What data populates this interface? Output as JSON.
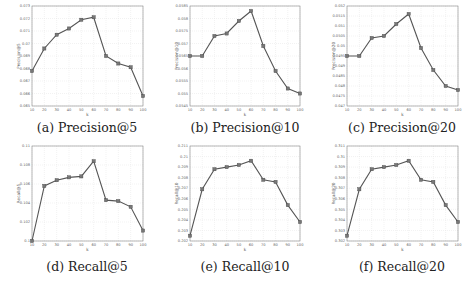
{
  "chart_data": [
    {
      "type": "line",
      "title": "",
      "caption": "(a) Precision@5",
      "xlabel": "k",
      "ylabel": "Precision@5",
      "x": [
        10,
        20,
        30,
        40,
        50,
        60,
        70,
        80,
        90,
        100
      ],
      "xticks": [
        "10",
        "20",
        "30",
        "40",
        "50",
        "60",
        "70",
        "80",
        "90",
        "100"
      ],
      "ylim": [
        0.065,
        0.073
      ],
      "yticks": [
        "0.065",
        "0.066",
        "0.067",
        "0.068",
        "0.069",
        "0.07",
        "0.071",
        "0.072",
        "0.073"
      ],
      "series": [
        {
          "name": "Precision@5",
          "values": [
            0.0678,
            0.0696,
            0.0707,
            0.0712,
            0.0719,
            0.0721,
            0.069,
            0.0684,
            0.0681,
            0.0658
          ]
        }
      ],
      "grid": true
    },
    {
      "type": "line",
      "caption": "(b) Precision@10",
      "xlabel": "k",
      "ylabel": "Precision@10",
      "x": [
        10,
        20,
        30,
        40,
        50,
        60,
        70,
        80,
        90,
        100
      ],
      "xticks": [
        "10",
        "20",
        "30",
        "40",
        "50",
        "60",
        "70",
        "80",
        "90",
        "100"
      ],
      "ylim": [
        0.0545,
        0.0585
      ],
      "yticks": [
        "0.0545",
        "0.055",
        "0.0555",
        "0.056",
        "0.0565",
        "0.057",
        "0.0575",
        "0.058",
        "0.0585"
      ],
      "series": [
        {
          "name": "Precision@10",
          "values": [
            0.0565,
            0.0565,
            0.0573,
            0.0574,
            0.0579,
            0.0583,
            0.0569,
            0.0559,
            0.0552,
            0.055
          ]
        }
      ],
      "grid": true
    },
    {
      "type": "line",
      "caption": "(c) Precision@20",
      "xlabel": "k",
      "ylabel": "Precision@20",
      "x": [
        10,
        20,
        30,
        40,
        50,
        60,
        70,
        80,
        90,
        100
      ],
      "xticks": [
        "10",
        "20",
        "30",
        "40",
        "50",
        "60",
        "70",
        "80",
        "90",
        "100"
      ],
      "ylim": [
        0.047,
        0.052
      ],
      "yticks": [
        "0.047",
        "0.0475",
        "0.048",
        "0.0485",
        "0.049",
        "0.0495",
        "0.05",
        "0.0505",
        "0.051",
        "0.0515",
        "0.052"
      ],
      "series": [
        {
          "name": "Precision@20",
          "values": [
            0.0495,
            0.0495,
            0.0504,
            0.0505,
            0.0511,
            0.0516,
            0.0499,
            0.0488,
            0.048,
            0.0478
          ]
        }
      ],
      "grid": true
    },
    {
      "type": "line",
      "caption": "(d) Recall@5",
      "xlabel": "k",
      "ylabel": "Recall@5",
      "x": [
        10,
        20,
        30,
        40,
        50,
        60,
        70,
        80,
        90,
        100
      ],
      "xticks": [
        "10",
        "20",
        "30",
        "40",
        "50",
        "60",
        "70",
        "80",
        "90",
        "100"
      ],
      "ylim": [
        0.1,
        0.11
      ],
      "yticks": [
        "0.1",
        "0.102",
        "0.104",
        "0.106",
        "0.108",
        "0.11"
      ],
      "series": [
        {
          "name": "Recall@5",
          "values": [
            0.1,
            0.1058,
            0.1064,
            0.1067,
            0.1068,
            0.1084,
            0.1043,
            0.1042,
            0.1036,
            0.1011
          ]
        }
      ],
      "grid": true
    },
    {
      "type": "line",
      "caption": "(e) Recall@10",
      "xlabel": "k",
      "ylabel": "Recall@10",
      "x": [
        10,
        20,
        30,
        40,
        50,
        60,
        70,
        80,
        90,
        100
      ],
      "xticks": [
        "10",
        "20",
        "30",
        "40",
        "50",
        "60",
        "70",
        "80",
        "90",
        "100"
      ],
      "ylim": [
        0.202,
        0.211
      ],
      "yticks": [
        "0.202",
        "0.203",
        "0.204",
        "0.205",
        "0.206",
        "0.207",
        "0.208",
        "0.209",
        "0.21",
        "0.211"
      ],
      "series": [
        {
          "name": "Recall@10",
          "values": [
            0.2025,
            0.2069,
            0.2088,
            0.209,
            0.2092,
            0.2096,
            0.2078,
            0.2076,
            0.2054,
            0.2038
          ]
        }
      ],
      "grid": true
    },
    {
      "type": "line",
      "caption": "(f) Recall@20",
      "xlabel": "k",
      "ylabel": "Recall@20",
      "x": [
        10,
        20,
        30,
        40,
        50,
        60,
        70,
        80,
        90,
        100
      ],
      "xticks": [
        "10",
        "20",
        "30",
        "40",
        "50",
        "60",
        "70",
        "80",
        "90",
        "100"
      ],
      "ylim": [
        0.302,
        0.311
      ],
      "yticks": [
        "0.302",
        "0.303",
        "0.304",
        "0.305",
        "0.306",
        "0.307",
        "0.308",
        "0.309",
        "0.31",
        "0.311"
      ],
      "series": [
        {
          "name": "Recall@20",
          "values": [
            0.3025,
            0.3069,
            0.3088,
            0.309,
            0.3092,
            0.3096,
            0.3078,
            0.3076,
            0.3054,
            0.3038
          ]
        }
      ],
      "grid": true
    }
  ],
  "layout": {
    "panels": [
      {
        "left": 32,
        "top": 6,
        "width": 111,
        "height": 100,
        "cap_x": 87,
        "cap_y": 120
      },
      {
        "left": 190,
        "top": 6,
        "width": 110,
        "height": 100,
        "cap_x": 245,
        "cap_y": 120
      },
      {
        "left": 347,
        "top": 6,
        "width": 111,
        "height": 100,
        "cap_x": 402,
        "cap_y": 120
      },
      {
        "left": 32,
        "top": 146,
        "width": 111,
        "height": 95,
        "cap_x": 87,
        "cap_y": 259
      },
      {
        "left": 190,
        "top": 146,
        "width": 110,
        "height": 95,
        "cap_x": 245,
        "cap_y": 259
      },
      {
        "left": 347,
        "top": 146,
        "width": 111,
        "height": 95,
        "cap_x": 402,
        "cap_y": 259
      }
    ],
    "line_color": "#555555",
    "marker_color": "#777777",
    "grid_color": "#e4e4e4",
    "frame_color": "#888888"
  }
}
